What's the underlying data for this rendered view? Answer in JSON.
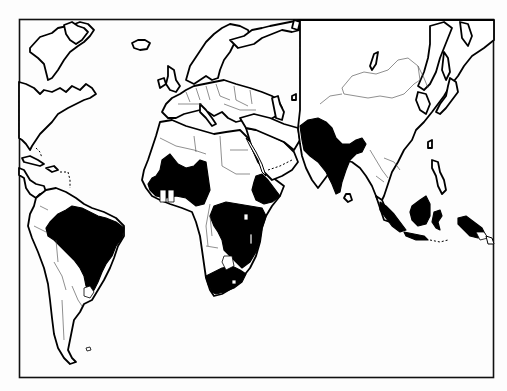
{
  "map": {
    "type": "world-choropleth",
    "projection": "miller-like, Atlantic-centered crop",
    "style": "black and white outline",
    "frame": {
      "x": 19,
      "y": 19,
      "width": 475,
      "height": 359
    },
    "colors": {
      "highlighted": "#000000",
      "land": "#ffffff",
      "border": "#000000",
      "frame": "#111111"
    },
    "highlighted_regions": [
      "Brazil",
      "West Africa (Mali, Niger, Burkina Faso, Guinea, Sierra Leone, Liberia, Côte d'Ivoire)",
      "Ethiopia",
      "Central & East Africa (DR Congo, Uganda, Kenya, Tanzania, Zambia, Mozambique, Zimbabwe, Malawi)",
      "South Africa",
      "India, Pakistan, Bangladesh",
      "Indonesia (Sumatra, Borneo, Sulawesi)",
      "Papua New Guinea"
    ],
    "legend": null,
    "title": null
  }
}
